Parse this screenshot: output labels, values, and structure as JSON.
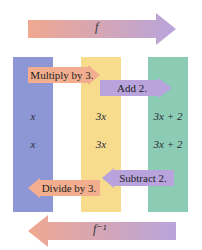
{
  "top_arrow": {
    "label": "f",
    "direction": "right",
    "gradient": [
      "#f0a890",
      "#b8a4dc"
    ]
  },
  "bottom_arrow": {
    "label": "f⁻¹",
    "direction": "left",
    "gradient": [
      "#f0a890",
      "#b8a4dc"
    ]
  },
  "columns": [
    {
      "color": "#8e97d6",
      "values": [
        "x",
        "x"
      ]
    },
    {
      "color": "#f6dc8c",
      "values": [
        "3x",
        "3x"
      ]
    },
    {
      "color": "#8ccbb4",
      "values": [
        "3x + 2",
        "3x + 2"
      ]
    }
  ],
  "steps": {
    "multiply": "Multiply by 3.",
    "add": "Add 2.",
    "subtract": "Subtract 2.",
    "divide": "Divide by 3."
  }
}
